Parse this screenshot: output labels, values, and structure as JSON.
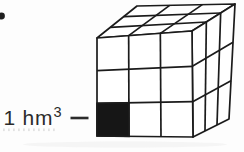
{
  "figure": {
    "background": "#fdfdfd",
    "bullet_icon": {
      "cx": 1.5,
      "cy": 16,
      "r": 3.4,
      "color": "#1f1f1f"
    },
    "label": {
      "text": "1 hm",
      "exponent": "3",
      "x": 3.5,
      "y": 125,
      "font_size": 21,
      "sup_size": 14.5,
      "sup_rise": 8,
      "letter_spacing": 0.8,
      "color": "#2b2b2b"
    },
    "leader_line": {
      "x1": 70.5,
      "y1": 118,
      "x2": 88.5,
      "y2": 118,
      "width": 2.6,
      "color": "#2b2b2b"
    },
    "cube": {
      "stroke": "#1b1b1b",
      "stroke_width": 1.7,
      "face_fill": "#ffffff",
      "shaded_fill": "#161616",
      "divisions": 3,
      "faces": {
        "top": {
          "corners": [
            [
              137,
              6
            ],
            [
              235,
              4
            ],
            [
              192,
              31
            ],
            [
              97,
              38
            ]
          ]
        },
        "right": {
          "corners": [
            [
              192,
              31
            ],
            [
              235,
              4
            ],
            [
              229,
              119
            ],
            [
              193,
              137
            ]
          ]
        },
        "front": {
          "corners": [
            [
              97,
              38
            ],
            [
              192,
              31
            ],
            [
              193,
              137
            ],
            [
              97,
              136
            ]
          ]
        }
      },
      "shaded_cell": {
        "face": "front",
        "col": 0,
        "row": 2
      }
    },
    "ghost_dots": {
      "x_start": 3,
      "x_end": 57,
      "y": 128.5,
      "step": 5,
      "dot_w": 1.8,
      "dot_h": 2.6,
      "color": "#c2c2c2",
      "opacity": 0.45
    },
    "scan_smudge": {
      "cx": 125,
      "cy": 144.5,
      "rx": 102,
      "ry": 3,
      "color": "#ededed",
      "opacity": 0.5
    }
  }
}
